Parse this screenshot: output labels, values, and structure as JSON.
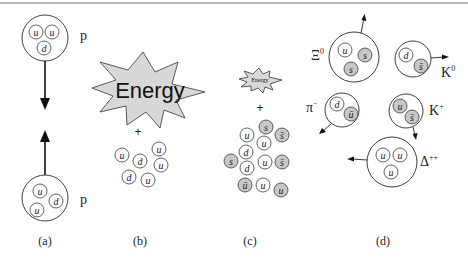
{
  "figure": {
    "panels": {
      "a": {
        "caption": "(a)",
        "top_particle": {
          "label": "p",
          "quarks": [
            "u",
            "u",
            "d"
          ]
        },
        "bottom_particle": {
          "label": "p",
          "quarks": [
            "u",
            "d",
            "u"
          ]
        }
      },
      "b": {
        "caption": "(b)",
        "energy_label": "Energy",
        "plus": "+",
        "quarks": [
          "u",
          "d",
          "u",
          "u",
          "d",
          "u"
        ]
      },
      "c": {
        "caption": "(c)",
        "energy_label": "Energy",
        "plus": "+",
        "quarks": [
          {
            "flavor": "s",
            "strange": true
          },
          {
            "flavor": "u",
            "strange": false
          },
          {
            "flavor": "s̄",
            "strange": true
          },
          {
            "flavor": "u",
            "strange": false
          },
          {
            "flavor": "d",
            "strange": false
          },
          {
            "flavor": "s",
            "strange": true
          },
          {
            "flavor": "d",
            "strange": false
          },
          {
            "flavor": "u",
            "strange": false
          },
          {
            "flavor": "s̄",
            "strange": true
          },
          {
            "flavor": "ū",
            "strange": true
          },
          {
            "flavor": "u",
            "strange": false
          },
          {
            "flavor": "u",
            "strange": true
          }
        ]
      },
      "d": {
        "caption": "(d)",
        "hadrons": [
          {
            "name": "Xi0",
            "label": "Ξ",
            "charge": "0",
            "quarks": [
              "u",
              "s",
              "s"
            ]
          },
          {
            "name": "K0",
            "label": "K",
            "charge": "0",
            "quarks": [
              "d",
              "s̄"
            ]
          },
          {
            "name": "pi-minus",
            "label": "π",
            "charge": "−",
            "quarks": [
              "d",
              "ū"
            ]
          },
          {
            "name": "K-plus",
            "label": "K",
            "charge": "+",
            "quarks": [
              "u",
              "s̄"
            ]
          },
          {
            "name": "Delta-plusplus",
            "label": "Δ",
            "charge": "++",
            "quarks": [
              "u",
              "u",
              "u"
            ]
          }
        ]
      }
    }
  }
}
